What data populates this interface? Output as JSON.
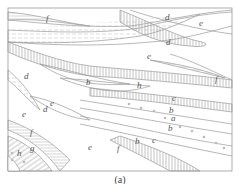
{
  "figure": {
    "caption": "(a)",
    "labels": [
      {
        "text": "f",
        "x": 46,
        "y": 21
      },
      {
        "text": "d",
        "x": 165,
        "y": 20
      },
      {
        "text": "e",
        "x": 199,
        "y": 26
      },
      {
        "text": "d",
        "x": 166,
        "y": 45
      },
      {
        "text": "e",
        "x": 147,
        "y": 59
      },
      {
        "text": "f",
        "x": 215,
        "y": 82
      },
      {
        "text": "d",
        "x": 24,
        "y": 79
      },
      {
        "text": "b",
        "x": 86,
        "y": 85
      },
      {
        "text": "h",
        "x": 137,
        "y": 88
      },
      {
        "text": "c",
        "x": 172,
        "y": 101
      },
      {
        "text": "b",
        "x": 169,
        "y": 113
      },
      {
        "text": "a",
        "x": 171,
        "y": 121
      },
      {
        "text": "b",
        "x": 168,
        "y": 131
      },
      {
        "text": "e",
        "x": 50,
        "y": 106
      },
      {
        "text": "d",
        "x": 43,
        "y": 112
      },
      {
        "text": "e",
        "x": 22,
        "y": 117
      },
      {
        "text": "f",
        "x": 30,
        "y": 135
      },
      {
        "text": "e",
        "x": 88,
        "y": 150
      },
      {
        "text": "f",
        "x": 117,
        "y": 151
      },
      {
        "text": "b",
        "x": 135,
        "y": 144
      },
      {
        "text": "c",
        "x": 152,
        "y": 143
      },
      {
        "text": "g",
        "x": 30,
        "y": 151
      },
      {
        "text": "h",
        "x": 17,
        "y": 156
      }
    ]
  }
}
